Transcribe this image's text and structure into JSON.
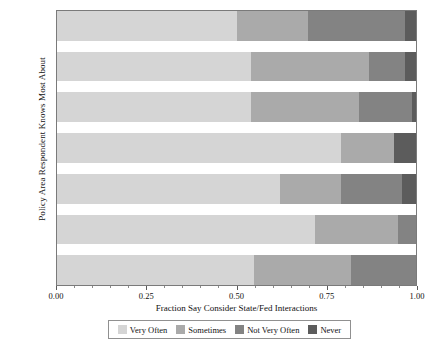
{
  "chart_data": {
    "type": "bar",
    "orientation": "horizontal",
    "stacked": true,
    "normalized": true,
    "title": "",
    "xlabel": "Fraction Say Consider State/Fed Interactions",
    "ylabel": "Policy Area Respondent Knows Most About",
    "xlim": [
      0.0,
      1.0
    ],
    "grid": false,
    "legend_position": "bottom",
    "categories": [
      "Crime",
      "Econ",
      "Edu",
      "Energy",
      "Env",
      "Health",
      "Immig"
    ],
    "xticks": [
      "0.00",
      "0.25",
      "0.50",
      "0.75",
      "1.00"
    ],
    "xtick_values": [
      0.0,
      0.25,
      0.5,
      0.75,
      1.0
    ],
    "series": [
      {
        "name": "Very Often",
        "color": "#d5d5d5",
        "values": [
          0.5,
          0.54,
          0.54,
          0.79,
          0.62,
          0.72,
          0.55
        ]
      },
      {
        "name": "Sometimes",
        "color": "#aaaaaa",
        "values": [
          0.2,
          0.33,
          0.3,
          0.15,
          0.17,
          0.23,
          0.27
        ]
      },
      {
        "name": "Not Very Often",
        "color": "#838383",
        "values": [
          0.27,
          0.1,
          0.15,
          0.0,
          0.17,
          0.05,
          0.18
        ]
      },
      {
        "name": "Never",
        "color": "#5c5c5c",
        "values": [
          0.03,
          0.03,
          0.01,
          0.06,
          0.04,
          0.0,
          0.0
        ]
      }
    ]
  },
  "legend": {
    "items": [
      {
        "label": "Very Often",
        "color": "#d5d5d5"
      },
      {
        "label": "Sometimes",
        "color": "#aaaaaa"
      },
      {
        "label": "Not Very Often",
        "color": "#838383"
      },
      {
        "label": "Never",
        "color": "#5c5c5c"
      }
    ]
  },
  "axes": {
    "x_title": "Fraction Say Consider State/Fed Interactions",
    "y_title": "Policy Area Respondent Knows Most About",
    "x_tick_labels": [
      "0.00",
      "0.25",
      "0.50",
      "0.75",
      "1.00"
    ],
    "y_tick_labels": [
      "Crime",
      "Econ",
      "Edu",
      "Energy",
      "Env",
      "Health",
      "Immig"
    ]
  }
}
